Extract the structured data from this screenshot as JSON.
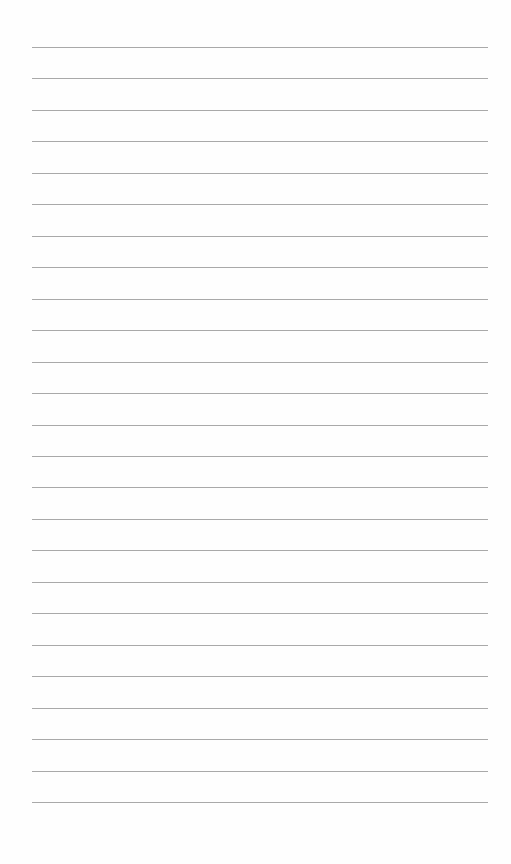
{
  "page": {
    "type": "lined-paper",
    "line_count": 25,
    "first_line_y": 47,
    "line_spacing": 31.46,
    "line_left": 32,
    "line_width": 456,
    "line_color": "#a9a9a9",
    "background": "#fefefe"
  }
}
